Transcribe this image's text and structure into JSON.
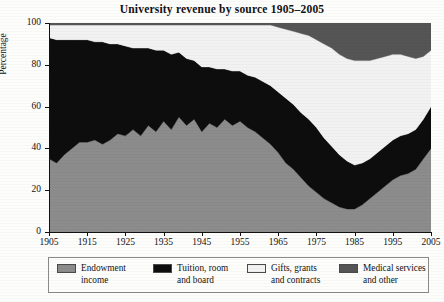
{
  "chart_data": {
    "type": "area",
    "stacked": true,
    "title": "University revenue by source 1905–2005",
    "xlabel": "",
    "ylabel": "Percentage",
    "xlim": [
      1905,
      2005
    ],
    "ylim": [
      0,
      100
    ],
    "grid": false,
    "legend_position": "bottom",
    "xticks": [
      "1905",
      "1915",
      "1925",
      "1935",
      "1945",
      "1955",
      "1965",
      "1975",
      "1985",
      "1995",
      "2005"
    ],
    "yticks": [
      "0",
      "20",
      "40",
      "60",
      "80",
      "100"
    ],
    "x": [
      1905,
      1907,
      1909,
      1911,
      1913,
      1915,
      1917,
      1919,
      1921,
      1923,
      1925,
      1927,
      1929,
      1931,
      1933,
      1935,
      1937,
      1939,
      1941,
      1943,
      1945,
      1947,
      1949,
      1951,
      1953,
      1955,
      1957,
      1959,
      1961,
      1963,
      1965,
      1967,
      1969,
      1971,
      1973,
      1975,
      1977,
      1979,
      1981,
      1983,
      1985,
      1987,
      1989,
      1991,
      1993,
      1995,
      1997,
      1999,
      2001,
      2003,
      2005
    ],
    "series": [
      {
        "name": "Endowment income",
        "color": "#8c8c8c",
        "values": [
          35,
          33,
          37,
          40,
          43,
          43,
          44,
          42,
          44,
          47,
          46,
          49,
          46,
          51,
          48,
          53,
          49,
          55,
          51,
          54,
          48,
          52,
          50,
          54,
          51,
          53,
          50,
          48,
          45,
          42,
          38,
          33,
          30,
          26,
          22,
          19,
          16,
          14,
          12,
          11,
          11,
          13,
          16,
          19,
          22,
          25,
          27,
          28,
          30,
          35,
          40
        ]
      },
      {
        "name": "Tuition, room and board",
        "color": "#0d0d0d",
        "values": [
          58,
          59,
          55,
          52,
          49,
          49,
          47,
          49,
          46,
          43,
          43,
          39,
          42,
          37,
          39,
          34,
          36,
          31,
          32,
          28,
          31,
          27,
          28,
          24,
          26,
          24,
          25,
          26,
          27,
          28,
          29,
          31,
          31,
          31,
          32,
          31,
          29,
          27,
          25,
          23,
          21,
          20,
          19,
          19,
          19,
          19,
          19,
          19,
          19,
          19,
          20
        ]
      },
      {
        "name": "Gifts, grants and contracts",
        "color": "#f2f2f2",
        "values": [
          6,
          7,
          7,
          7,
          7,
          7,
          8,
          8,
          9,
          9,
          10,
          11,
          11,
          11,
          12,
          12,
          14,
          13,
          16,
          17,
          20,
          20,
          21,
          21,
          22,
          22,
          24,
          25,
          27,
          29,
          31,
          33,
          35,
          38,
          40,
          42,
          45,
          47,
          48,
          49,
          50,
          49,
          47,
          45,
          43,
          41,
          39,
          37,
          34,
          30,
          27
        ]
      },
      {
        "name": "Medical services and other",
        "color": "#555555",
        "values": [
          1,
          1,
          1,
          1,
          1,
          1,
          1,
          1,
          1,
          1,
          1,
          1,
          1,
          1,
          1,
          1,
          1,
          1,
          1,
          1,
          1,
          1,
          1,
          1,
          1,
          1,
          1,
          1,
          1,
          1,
          2,
          3,
          4,
          5,
          6,
          8,
          10,
          12,
          15,
          17,
          18,
          18,
          18,
          17,
          16,
          15,
          15,
          16,
          17,
          16,
          13
        ]
      }
    ]
  },
  "legend": {
    "items": [
      {
        "label": "Endowment\nincome",
        "swatch": "#8c8c8c"
      },
      {
        "label": "Tuition, room\nand board",
        "swatch": "#0d0d0d"
      },
      {
        "label": "Gifts, grants\nand contracts",
        "swatch": "#f2f2f2"
      },
      {
        "label": "Medical services\nand other",
        "swatch": "#555555"
      }
    ]
  }
}
